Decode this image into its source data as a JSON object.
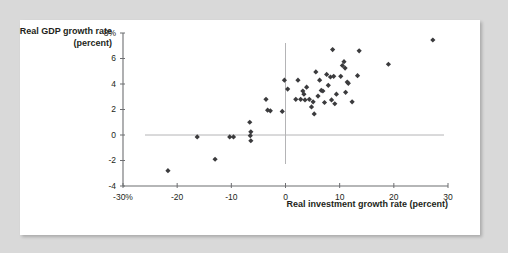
{
  "chart_data": {
    "type": "scatter",
    "title": "",
    "xlabel": "Real investment growth rate (percent)",
    "ylabel": "Real GDP growth rate (percent)",
    "xlim": [
      -30,
      30
    ],
    "ylim": [
      -4,
      8
    ],
    "grid": false,
    "legend": null,
    "x_ticks": [
      -30,
      -20,
      -10,
      0,
      10,
      20,
      30
    ],
    "y_ticks": [
      -4,
      -2,
      0,
      2,
      4,
      6,
      8
    ],
    "x_tick_labels": [
      "-30%",
      "-20",
      "-10",
      "0",
      "10",
      "20",
      "30"
    ],
    "y_tick_labels": [
      "-4",
      "-2",
      "0",
      "2",
      "4",
      "6",
      "8%"
    ],
    "marker": "diamond",
    "marker_color": "#3b3b3d",
    "reference_lines": [
      {
        "axis": "y",
        "value": 0
      },
      {
        "axis": "x",
        "value": 0
      }
    ],
    "points": [
      {
        "x": -21.7,
        "y": -2.8
      },
      {
        "x": -16.3,
        "y": -0.15
      },
      {
        "x": -13.0,
        "y": -1.9
      },
      {
        "x": -10.3,
        "y": -0.15
      },
      {
        "x": -9.6,
        "y": -0.15
      },
      {
        "x": -6.6,
        "y": 1.0
      },
      {
        "x": -6.4,
        "y": 0.25
      },
      {
        "x": -6.5,
        "y": -0.05
      },
      {
        "x": -6.4,
        "y": -0.45
      },
      {
        "x": -3.6,
        "y": 2.8
      },
      {
        "x": -3.3,
        "y": 1.95
      },
      {
        "x": -2.8,
        "y": 1.9
      },
      {
        "x": -0.6,
        "y": 1.85
      },
      {
        "x": -0.2,
        "y": 4.3
      },
      {
        "x": 0.4,
        "y": 3.6
      },
      {
        "x": 1.9,
        "y": 2.8
      },
      {
        "x": 2.3,
        "y": 4.3
      },
      {
        "x": 2.8,
        "y": 2.8
      },
      {
        "x": 3.2,
        "y": 3.45
      },
      {
        "x": 3.4,
        "y": 3.2
      },
      {
        "x": 3.6,
        "y": 2.75
      },
      {
        "x": 3.9,
        "y": 3.75
      },
      {
        "x": 4.4,
        "y": 2.8
      },
      {
        "x": 4.8,
        "y": 2.2
      },
      {
        "x": 5.1,
        "y": 2.6
      },
      {
        "x": 5.3,
        "y": 1.65
      },
      {
        "x": 5.6,
        "y": 4.95
      },
      {
        "x": 6.0,
        "y": 3.05
      },
      {
        "x": 6.3,
        "y": 4.3
      },
      {
        "x": 6.6,
        "y": 3.5
      },
      {
        "x": 6.9,
        "y": 3.45
      },
      {
        "x": 7.2,
        "y": 2.55
      },
      {
        "x": 7.6,
        "y": 4.75
      },
      {
        "x": 7.9,
        "y": 3.9
      },
      {
        "x": 8.3,
        "y": 4.55
      },
      {
        "x": 8.5,
        "y": 2.75
      },
      {
        "x": 8.7,
        "y": 6.7
      },
      {
        "x": 8.9,
        "y": 4.6
      },
      {
        "x": 9.1,
        "y": 2.45
      },
      {
        "x": 9.4,
        "y": 3.2
      },
      {
        "x": 10.2,
        "y": 4.6
      },
      {
        "x": 10.5,
        "y": 5.45
      },
      {
        "x": 10.8,
        "y": 5.75
      },
      {
        "x": 11.0,
        "y": 5.25
      },
      {
        "x": 11.1,
        "y": 3.35
      },
      {
        "x": 11.4,
        "y": 4.15
      },
      {
        "x": 11.6,
        "y": 4.05
      },
      {
        "x": 12.3,
        "y": 2.6
      },
      {
        "x": 13.3,
        "y": 4.65
      },
      {
        "x": 13.6,
        "y": 6.6
      },
      {
        "x": 19.0,
        "y": 5.55
      },
      {
        "x": 27.2,
        "y": 7.45
      }
    ]
  }
}
